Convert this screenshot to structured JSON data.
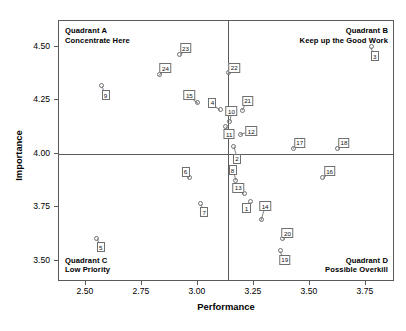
{
  "chart_data": {
    "type": "scatter",
    "title": "",
    "xlabel": "Performance",
    "ylabel": "Importance",
    "xlim": [
      2.38,
      3.88
    ],
    "ylim": [
      3.4,
      4.62
    ],
    "xticks": [
      "2.50",
      "2.75",
      "3.00",
      "3.25",
      "3.50",
      "3.75"
    ],
    "xtick_values": [
      2.5,
      2.75,
      3.0,
      3.25,
      3.5,
      3.75
    ],
    "yticks": [
      "3.50",
      "3.75",
      "4.00",
      "4.25",
      "4.50"
    ],
    "ytick_values": [
      3.5,
      3.75,
      4.0,
      4.25,
      4.5
    ],
    "grid": false,
    "legend": "none",
    "reference_lines": {
      "x": 3.135,
      "y": 4.0
    },
    "points": [
      {
        "label": "1",
        "x": 3.235,
        "y": 3.775,
        "lx": 3.217,
        "ly": 3.745
      },
      {
        "label": "2",
        "x": 3.16,
        "y": 4.035,
        "lx": 3.175,
        "ly": 3.975
      },
      {
        "label": "3",
        "x": 3.775,
        "y": 4.5,
        "lx": 3.79,
        "ly": 4.455
      },
      {
        "label": "4",
        "x": 3.1,
        "y": 4.205,
        "lx": 3.065,
        "ly": 4.237
      },
      {
        "label": "5",
        "x": 2.548,
        "y": 3.605,
        "lx": 2.566,
        "ly": 3.562
      },
      {
        "label": "6",
        "x": 2.962,
        "y": 3.888,
        "lx": 2.945,
        "ly": 3.915
      },
      {
        "label": "7",
        "x": 3.012,
        "y": 3.765,
        "lx": 3.028,
        "ly": 3.725
      },
      {
        "label": "8",
        "x": 3.168,
        "y": 3.875,
        "lx": 3.155,
        "ly": 3.922
      },
      {
        "label": "9",
        "x": 2.57,
        "y": 4.318,
        "lx": 2.588,
        "ly": 4.272
      },
      {
        "label": "10",
        "x": 3.143,
        "y": 4.152,
        "lx": 3.15,
        "ly": 4.198
      },
      {
        "label": "11",
        "x": 3.125,
        "y": 4.128,
        "lx": 3.14,
        "ly": 4.09
      },
      {
        "label": "12",
        "x": 3.19,
        "y": 4.09,
        "lx": 3.238,
        "ly": 4.105
      },
      {
        "label": "13",
        "x": 3.208,
        "y": 3.812,
        "lx": 3.18,
        "ly": 3.84
      },
      {
        "label": "14",
        "x": 3.282,
        "y": 3.69,
        "lx": 3.3,
        "ly": 3.755
      },
      {
        "label": "15",
        "x": 3.0,
        "y": 4.238,
        "lx": 2.962,
        "ly": 4.272
      },
      {
        "label": "16",
        "x": 3.558,
        "y": 3.888,
        "lx": 3.588,
        "ly": 3.918
      },
      {
        "label": "17",
        "x": 3.425,
        "y": 4.025,
        "lx": 3.455,
        "ly": 4.05
      },
      {
        "label": "18",
        "x": 3.625,
        "y": 4.022,
        "lx": 3.652,
        "ly": 4.05
      },
      {
        "label": "19",
        "x": 3.368,
        "y": 3.545,
        "lx": 3.388,
        "ly": 3.505
      },
      {
        "label": "20",
        "x": 3.378,
        "y": 3.602,
        "lx": 3.4,
        "ly": 3.628
      },
      {
        "label": "21",
        "x": 3.198,
        "y": 4.202,
        "lx": 3.222,
        "ly": 4.248
      },
      {
        "label": "22",
        "x": 3.135,
        "y": 4.378,
        "lx": 3.162,
        "ly": 4.402
      },
      {
        "label": "23",
        "x": 2.918,
        "y": 4.462,
        "lx": 2.945,
        "ly": 4.492
      },
      {
        "label": "24",
        "x": 2.828,
        "y": 4.368,
        "lx": 2.855,
        "ly": 4.398
      }
    ],
    "quadrants": [
      {
        "id": "A",
        "title": "Quadrant A",
        "subtitle": "Concentrate Here",
        "position": "top-left"
      },
      {
        "id": "B",
        "title": "Quadrant B",
        "subtitle": "Keep up the Good Work",
        "position": "top-right"
      },
      {
        "id": "C",
        "title": "Quadrant C",
        "subtitle": "Low Priority",
        "position": "bottom-left"
      },
      {
        "id": "D",
        "title": "Quadrant D",
        "subtitle": "Possible Overkill",
        "position": "bottom-right"
      }
    ]
  }
}
